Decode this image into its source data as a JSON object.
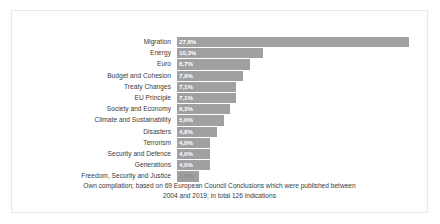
{
  "figure": {
    "border_color": "#e8e8e8",
    "background": "#ffffff"
  },
  "caption": {
    "line1": "Own compilation; based on  69 European Council Conclusions which were published between",
    "line2": "2004 and 2019; in total 126 indications"
  },
  "chart_data": {
    "type": "bar",
    "orientation": "horizontal",
    "title": "",
    "xlabel": "",
    "ylabel": "",
    "grid": false,
    "legend": false,
    "bar_color": "#a0a0a0",
    "label_color": "#ffffff",
    "xlim": [
      0,
      30
    ],
    "value_suffix": "%",
    "decimal_separator": ",",
    "categories": [
      "Migration",
      "Energy",
      "Euro",
      "Budget and Cohesion",
      "Treaty Changes",
      "EU Principle",
      "Society and Economy",
      "Climate and Sustainability",
      "Disasters",
      "Terrorism",
      "Security and Defence",
      "Generations",
      "Freedom, Security and Justice"
    ],
    "values": [
      27.8,
      10.3,
      8.7,
      7.9,
      7.1,
      7.1,
      6.3,
      5.6,
      4.8,
      4.0,
      4.0,
      4.0,
      2.6
    ],
    "value_labels": [
      "27,8%",
      "10,3%",
      "8,7%",
      "7,9%",
      "7,1%",
      "7,1%",
      "6,3%",
      "5,6%",
      "4,8%",
      "4,0%",
      "4,0%",
      "4,0%",
      "2,6%"
    ]
  }
}
